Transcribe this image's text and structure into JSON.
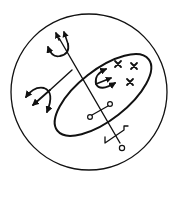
{
  "figure": {
    "title": "Sigil seal",
    "background": "#ffffff",
    "ink_color": "#111111",
    "elements": [
      {
        "name": "outer-circle"
      },
      {
        "name": "tilted-ellipse"
      },
      {
        "name": "central-staff"
      },
      {
        "name": "top-trident"
      },
      {
        "name": "left-trident"
      },
      {
        "name": "middle-trident"
      },
      {
        "name": "cross-marks",
        "count": 3
      },
      {
        "name": "crossbar-with-rings"
      },
      {
        "name": "hooked-crossbar"
      },
      {
        "name": "staff-end-ring"
      }
    ]
  }
}
